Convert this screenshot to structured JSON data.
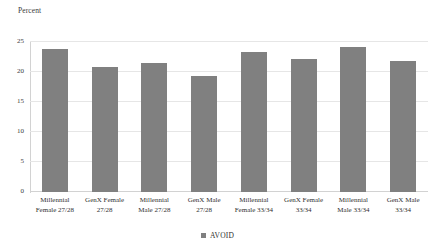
{
  "chart_data": {
    "type": "bar",
    "title": "",
    "xlabel": "",
    "ylabel": "Percent",
    "ylim": [
      0,
      25
    ],
    "yticks": [
      0,
      5,
      10,
      15,
      20,
      25
    ],
    "grid": true,
    "legend_position": "bottom-center",
    "categories": [
      "Millennial Female 27/28",
      "GenX Female 27/28",
      "Millennial Male 27/28",
      "GenX Male 27/28",
      "Millennial Female 33/34",
      "GenX Female 33/34",
      "Millennial Male 33/34",
      "GenX Male 33/34"
    ],
    "category_lines": [
      [
        "Millennial",
        "Female 27/28"
      ],
      [
        "GenX Female",
        "27/28"
      ],
      [
        "Millennial",
        "Male 27/28"
      ],
      [
        "GenX Male",
        "27/28"
      ],
      [
        "Millennial",
        "Female 33/34"
      ],
      [
        "GenX Female",
        "33/34"
      ],
      [
        "Millennial",
        "Male 33/34"
      ],
      [
        "GenX Male",
        "33/34"
      ]
    ],
    "series": [
      {
        "name": "AVOID",
        "color": "#808080",
        "values": [
          23.8,
          20.8,
          21.5,
          19.3,
          23.3,
          22.2,
          24.2,
          21.8
        ]
      }
    ]
  },
  "legend": {
    "items": [
      {
        "label": "AVOID",
        "color": "#808080",
        "marker": "square"
      }
    ]
  },
  "colors": {
    "bar": "#808080",
    "gridline": "#e6e6e6",
    "axis": "#d2d2d2",
    "text": "#2f2f2f",
    "background": "#ffffff"
  }
}
